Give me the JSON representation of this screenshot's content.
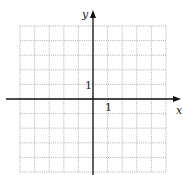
{
  "figure": {
    "type": "coordinate-grid",
    "x_axis_label": "x",
    "y_axis_label": "y",
    "x_tick_label": "1",
    "y_tick_label": "1",
    "grid_range": {
      "x": [
        -5,
        5
      ],
      "y": [
        -5,
        5
      ]
    },
    "grid_style": "dotted",
    "grid_color": "#9a9a9a",
    "axis_color": "#111111"
  }
}
